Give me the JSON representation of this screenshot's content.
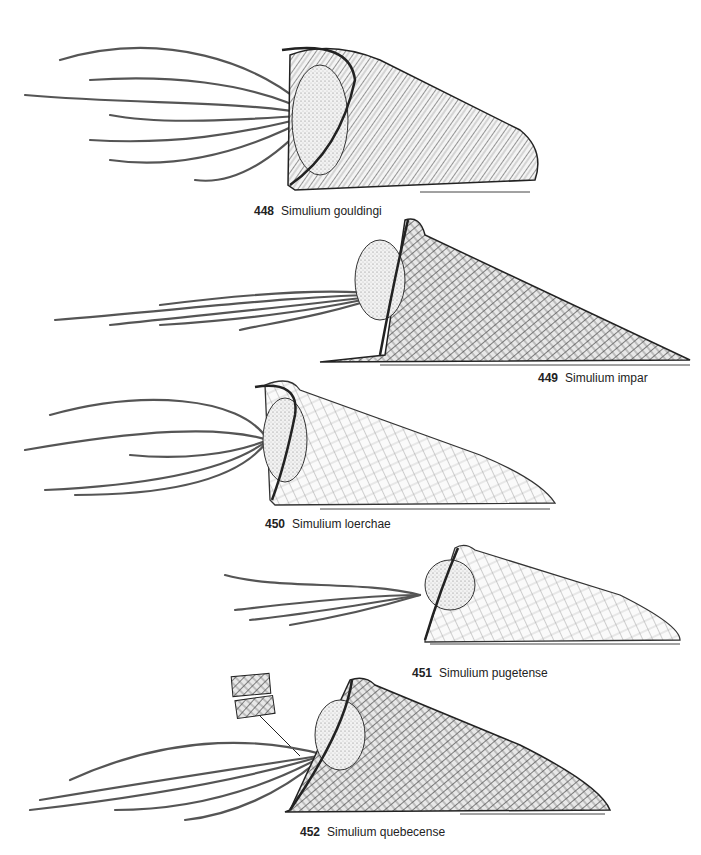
{
  "plate": {
    "figures": [
      {
        "number": "448",
        "species": "Simulium gouldingi",
        "style": "coarse-mesh"
      },
      {
        "number": "449",
        "species": "Simulium impar",
        "style": "dense-mesh"
      },
      {
        "number": "450",
        "species": "Simulium loerchae",
        "style": "fine-mesh"
      },
      {
        "number": "451",
        "species": "Simulium pugetense",
        "style": "fine-stippled"
      },
      {
        "number": "452",
        "species": "Simulium quebecense",
        "style": "dense-mesh",
        "inset": "gill-filament-detail"
      }
    ]
  },
  "colors": {
    "ink": "#222222",
    "background": "#ffffff"
  }
}
